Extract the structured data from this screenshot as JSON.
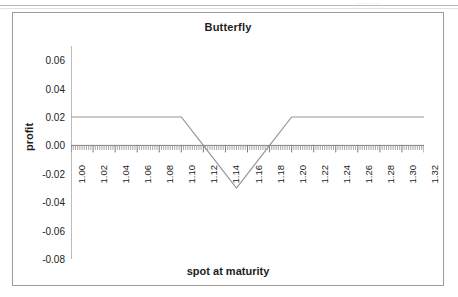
{
  "page": {
    "header_fragment": "............."
  },
  "chart": {
    "title": "Butterfly",
    "xlabel": "spot at maturity",
    "ylabel": "profit"
  },
  "chart_data": {
    "type": "line",
    "title": "Butterfly",
    "xlabel": "spot at maturity",
    "ylabel": "profit",
    "xlim": [
      1.0,
      1.32
    ],
    "ylim": [
      -0.08,
      0.07
    ],
    "grid": false,
    "legend": false,
    "line_color": "#969696",
    "axis_color": "#7a7a7a",
    "xticks": [
      "1.00",
      "1.02",
      "1.04",
      "1.06",
      "1.08",
      "1.10",
      "1.12",
      "1.14",
      "1.16",
      "1.18",
      "1.20",
      "1.22",
      "1.24",
      "1.26",
      "1.28",
      "1.30",
      "1.32"
    ],
    "yticks": [
      "0.06",
      "0.04",
      "0.02",
      "0.00",
      "-0.02",
      "-0.04",
      "-0.06",
      "-0.08"
    ],
    "ytick_values": [
      0.06,
      0.04,
      0.02,
      0.0,
      -0.02,
      -0.04,
      -0.06,
      -0.08
    ],
    "series": [
      {
        "name": "butterfly payoff",
        "x": [
          1.0,
          1.02,
          1.04,
          1.06,
          1.08,
          1.1,
          1.12,
          1.14,
          1.15,
          1.16,
          1.18,
          1.2,
          1.22,
          1.24,
          1.26,
          1.28,
          1.3,
          1.32
        ],
        "values": [
          0.02,
          0.02,
          0.02,
          0.02,
          0.02,
          0.02,
          0.0,
          -0.02,
          -0.03,
          -0.02,
          0.0,
          0.02,
          0.02,
          0.02,
          0.02,
          0.02,
          0.02,
          0.02
        ]
      }
    ],
    "annotations": [
      {
        "text": "flat profit 0.02 below 1.10 and above 1.20"
      },
      {
        "text": "minimum profit -0.03 at spot 1.15"
      }
    ]
  }
}
